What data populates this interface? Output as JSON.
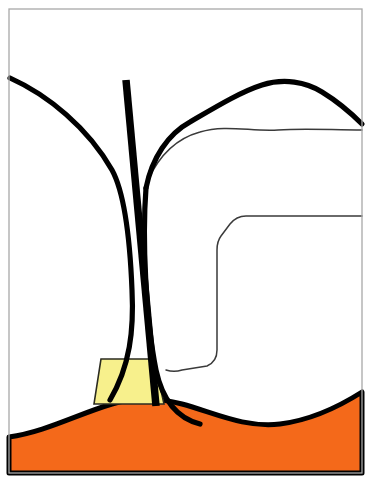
{
  "figure": {
    "domain": "diagram",
    "canvas": {
      "width": 373,
      "height": 483,
      "background": "#ffffff"
    }
  },
  "colors": {
    "gingiva_orange": "#F4691A",
    "sulcus_yellow": "#F7F08C",
    "outline_black": "#000000",
    "thin_line_gray": "#3A3A3A",
    "frame_gray": "#A8A8A8",
    "tooth_white": "#FFFFFF"
  },
  "frame": {
    "name": "image-border",
    "x": 9,
    "y": 9,
    "width": 353,
    "height": 464,
    "stroke": "#A8A8A8",
    "stroke_width": 1.3
  },
  "regions": [
    {
      "id": "gingiva",
      "label": "Gingiva",
      "fill": "#F4691A",
      "outline": "#000000",
      "outline_width": 5,
      "path": "M 9 437 C 45 432 78 414 112 404 C 138 396 160 398 182 404 C 215 413 244 428 280 424 C 312 420 340 406 362 392 L 362 473 L 9 473 Z"
    },
    {
      "id": "sulcus-pocket",
      "label": "Gingival sulcus / periodontal pocket",
      "fill": "#F7F08C",
      "outline": "#2B2B20",
      "outline_width": 1.6,
      "path": "M 101 359 L 154 359 L 164 404 L 94 404 Z"
    }
  ],
  "strokes": [
    {
      "id": "left-tooth-crown-outline",
      "label": "Left tooth crown and root outline",
      "stroke": "#000000",
      "width": 5.2,
      "path": "M 10 78 C 48 95 88 128 112 170 C 124 192 130 240 132 290 C 134 330 130 366 110 400"
    },
    {
      "id": "right-tooth-crown-outline",
      "label": "Right tooth crown and root outline",
      "stroke": "#000000",
      "width": 5.2,
      "path": "M 146 188 C 152 158 168 134 190 122 C 214 108 240 92 262 85 C 284 78 306 82 322 92 C 340 103 352 114 362 124"
    },
    {
      "id": "right-tooth-root-outline",
      "label": "Right tooth root descending to gingiva",
      "stroke": "#000000",
      "width": 5.2,
      "path": "M 146 188 C 142 240 146 320 156 370 C 162 398 176 418 200 424"
    },
    {
      "id": "periodontal-probe",
      "label": "Periodontal probe",
      "stroke": "#000000",
      "width": 7.5,
      "path": "M 126 80 L 156 406"
    },
    {
      "id": "dentino-enamel-junction",
      "label": "Dentino-enamel junction (thin inner line)",
      "stroke": "#3A3A3A",
      "width": 1.5,
      "path": "M 148 180 C 160 154 178 138 200 132 C 226 124 252 132 278 130 C 304 128 332 130 362 130"
    },
    {
      "id": "restoration-outline",
      "label": "Restoration / filling outline (thin rounded line)",
      "stroke": "#3A3A3A",
      "width": 1.5,
      "path": "M 362 216 L 246 216 C 238 216 234 219 230 224 L 221 236 C 218 240 217 244 217 250 L 217 350 C 217 358 214 363 207 366 L 182 370 C 176 372 172 372 166 370"
    }
  ],
  "annotations": {
    "visible_text": [],
    "note": "No text labels are rendered in this figure."
  }
}
